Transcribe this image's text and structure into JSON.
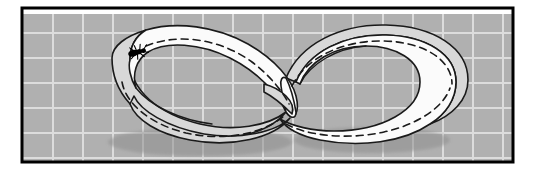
{
  "figure": {
    "kind": "mobius-strip-illustration",
    "canvas": {
      "width": 535,
      "height": 175,
      "background": "#ffffff"
    },
    "frame": {
      "label": "black rectangular border",
      "x": 22,
      "y": 8,
      "width": 491,
      "height": 154,
      "stroke": "#000000",
      "stroke_width": 3,
      "fill": "none"
    },
    "graph_paper": {
      "label": "gray grid background",
      "fill": "#b0b0b0",
      "grid_line_color": "#dcdcdc",
      "grid_line_width": 2,
      "cell_width": 30,
      "cell_height": 25,
      "x": 23,
      "y": 14,
      "width": 489,
      "height": 147,
      "vertical_lines": [
        53,
        83,
        113,
        143,
        173,
        203,
        233,
        263,
        293,
        323,
        353,
        383,
        413,
        443,
        473,
        503
      ],
      "horizontal_lines": [
        33,
        58,
        83,
        108,
        133,
        158
      ]
    },
    "band": {
      "label": "mobius band surface",
      "front_fill": "#fbfbfb",
      "back_fill": "#d8d8d8",
      "shadow_fill": "#8f8f8f",
      "outline_color": "#1a1a1a",
      "outline_width": 1.6,
      "centerline": {
        "label": "dashed center line",
        "color": "#1a1a1a",
        "width": 1.6,
        "dash": "7 5"
      },
      "twist_count": 1,
      "loops": 2,
      "shape": "figure-eight"
    },
    "ant": {
      "label": "ant walking on the strip",
      "color": "#000000",
      "x": 138,
      "y": 52,
      "scale": 1.0,
      "rotation_deg": -14
    }
  },
  "colors": {
    "paper_gray": "#b0b0b0",
    "grid_light": "#dcdcdc",
    "band_white": "#fbfbfb",
    "band_shade": "#d8d8d8",
    "ink_black": "#000000",
    "shadow_gray": "#8f8f8f"
  }
}
